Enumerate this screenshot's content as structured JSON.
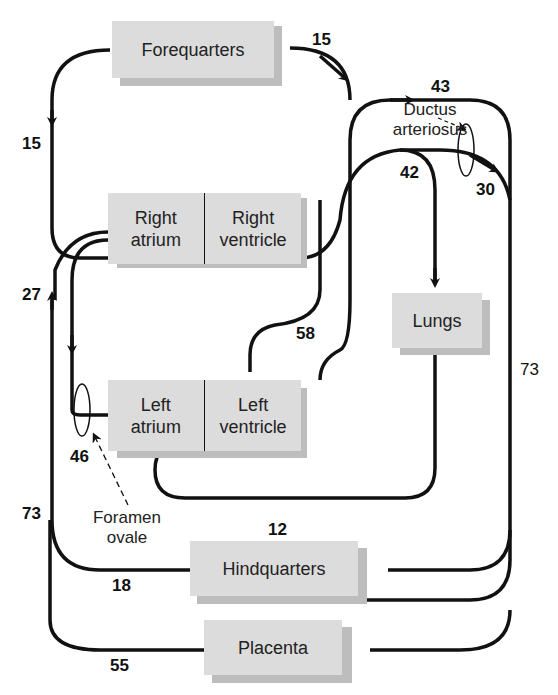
{
  "diagram": {
    "nodes": {
      "forequarters": "Forequarters",
      "right_atrium": "Right atrium",
      "right_atrium_l1": "Right",
      "right_atrium_l2": "atrium",
      "right_ventricle_l1": "Right",
      "right_ventricle_l2": "ventricle",
      "lungs": "Lungs",
      "left_atrium_l1": "Left",
      "left_atrium_l2": "atrium",
      "left_ventricle_l1": "Left",
      "left_ventricle_l2": "ventricle",
      "hindquarters": "Hindquarters",
      "placenta": "Placenta"
    },
    "annotations": {
      "ductus_l1": "Ductus",
      "ductus_l2": "arteriosus",
      "foramen_l1": "Foramen",
      "foramen_l2": "ovale"
    },
    "flow_values": {
      "forequarters_in": "15",
      "forequarters_out": "15",
      "aorta_arch": "43",
      "pulmonary_trunk": "42",
      "ductus_flow": "30",
      "svc_ivc_return": "27",
      "left_ventricle_out": "58",
      "foramen_flow": "46",
      "descending_aorta": "73",
      "ivc_return": "73",
      "lungs_return": "12",
      "hindquarters_return": "18",
      "placenta_return": "55"
    },
    "colors": {
      "box_fill": "#dcdcdc",
      "box_shadow": "#bdbdbd",
      "line": "#111111"
    }
  }
}
